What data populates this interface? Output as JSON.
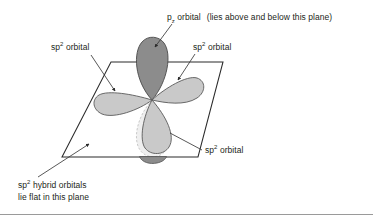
{
  "figure": {
    "labels": {
      "pz_orbital": {
        "symbol": "p",
        "subscript": "z",
        "text_after": "orbital",
        "parenthetical": "(lies above and below this plane)"
      },
      "sp2_left": {
        "symbol": "sp",
        "superscript": "2",
        "text_after": "orbital"
      },
      "sp2_right": {
        "symbol": "sp",
        "superscript": "2",
        "text_after": "orbital"
      },
      "sp2_lower": {
        "symbol": "sp",
        "superscript": "2",
        "text_after": "orbital"
      },
      "plane_note": {
        "symbol": "sp",
        "superscript": "2",
        "line1_after": "hybrid orbitals",
        "line2": "lie flat in this plane"
      }
    },
    "colors": {
      "pz_lobe_fill": "#8c8c8c",
      "pz_lobe_stroke": "#4a4a4a",
      "sp2_lobe_fill": "#c9c9c9",
      "sp2_lobe_stroke": "#5a5a5a",
      "pz_lower_ghost_fill": "#ededed",
      "pz_lower_ghost_stroke": "#b8b8b8",
      "pz_lower_cap_fill": "#8c8c8c",
      "plane_stroke": "#2b2b2b",
      "leader_stroke": "#3a3a3a",
      "text": "#231f20",
      "rule": "#9a9a9a",
      "background": "#ffffff"
    },
    "geometry": {
      "plane_corners": [
        [
          111,
          62
        ],
        [
          223,
          62
        ],
        [
          198,
          157
        ],
        [
          62,
          157
        ]
      ],
      "orbital_center": [
        152,
        100
      ],
      "pz_up_tip_y": 38,
      "sp2_down_tip_y": 152
    }
  }
}
